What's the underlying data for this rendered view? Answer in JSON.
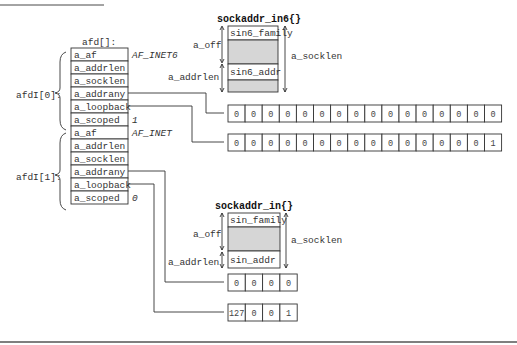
{
  "afd_array": {
    "title": "afd[]:",
    "groups": [
      {
        "label": "afdI[0]:",
        "fields": [
          "a_af",
          "a_addrlen",
          "a_socklen",
          "a_addrany",
          "a_loopback",
          "a_scoped"
        ],
        "values": {
          "a_af": "AF_INET6",
          "a_scoped": "1"
        }
      },
      {
        "label": "afdI[1]:",
        "fields": [
          "a_af",
          "a_addrlen",
          "a_socklen",
          "a_addrany",
          "a_loopback",
          "a_scoped"
        ],
        "values": {
          "a_af": "AF_INET",
          "a_scoped": "0"
        }
      }
    ]
  },
  "sockaddr_in6": {
    "title": "sockaddr_in6{}",
    "fields": [
      "sin6_family",
      "",
      "sin6_addr",
      ""
    ],
    "labels": {
      "off": "a_off",
      "addrlen": "a_addrlen",
      "socklen": "a_socklen"
    }
  },
  "sockaddr_in": {
    "title": "sockaddr_in{}",
    "fields": [
      "sin_family",
      "",
      "sin_addr"
    ],
    "labels": {
      "off": "a_off",
      "addrlen": "a_addrlen",
      "socklen": "a_socklen"
    }
  },
  "byte_arrays": {
    "in6_addrany": [
      "0",
      "0",
      "0",
      "0",
      "0",
      "0",
      "0",
      "0",
      "0",
      "0",
      "0",
      "0",
      "0",
      "0",
      "0",
      "0"
    ],
    "in6_loopback": [
      "0",
      "0",
      "0",
      "0",
      "0",
      "0",
      "0",
      "0",
      "0",
      "0",
      "0",
      "0",
      "0",
      "0",
      "0",
      "1"
    ],
    "in_addrany": [
      "0",
      "0",
      "0",
      "0"
    ],
    "in_loopback": [
      "127",
      "0",
      "0",
      "1"
    ]
  }
}
